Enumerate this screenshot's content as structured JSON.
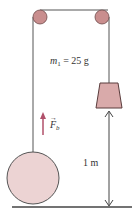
{
  "diagram": {
    "mass_label": "m",
    "mass_subscript": "1",
    "mass_value": " = 25 g",
    "force_label": "F",
    "force_subscript": "b",
    "height_label": "1 m",
    "colors": {
      "pulley": "#c98e8e",
      "weight": "#d9aaaa",
      "balloon": "#ecd3d3",
      "string": "#555555",
      "arrow": "#b0506a",
      "ground": "#444444"
    }
  }
}
